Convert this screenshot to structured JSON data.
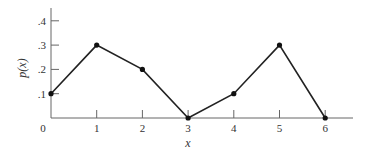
{
  "chart_data": {
    "type": "line",
    "title": "",
    "xlabel": "x",
    "ylabel": "p(x)",
    "x": [
      0,
      1,
      2,
      3,
      4,
      5,
      6
    ],
    "values": [
      0.1,
      0.3,
      0.2,
      0.0,
      0.1,
      0.3,
      0.0
    ],
    "x_ticks": [
      "0",
      "1",
      "2",
      "3",
      "4",
      "5",
      "6"
    ],
    "y_ticks": [
      ".1",
      ".2",
      ".3",
      ".4"
    ],
    "xlim": [
      0,
      6.6
    ],
    "ylim": [
      0,
      0.45
    ],
    "grid": false,
    "legend": null,
    "markers": true,
    "line_color": "#222222"
  }
}
